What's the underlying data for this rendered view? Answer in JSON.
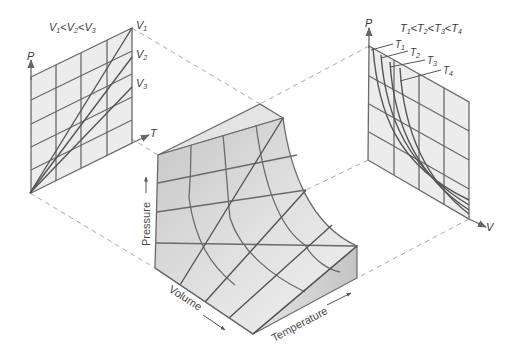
{
  "figure": {
    "left_panel": {
      "title": "V₁<V₂<V₃",
      "title_parts": [
        "V",
        "1",
        "<",
        "V",
        "2",
        "<",
        "V",
        "3"
      ],
      "y_axis_label": "P",
      "x_axis_label": "T",
      "isochore_labels": [
        {
          "base": "V",
          "sub": "1"
        },
        {
          "base": "V",
          "sub": "2"
        },
        {
          "base": "V",
          "sub": "3"
        }
      ]
    },
    "right_panel": {
      "title": "T₁<T₂<T₃<T₄",
      "y_axis_label": "P",
      "x_axis_label": "V",
      "isotherm_labels": [
        {
          "base": "T",
          "sub": "1"
        },
        {
          "base": "T",
          "sub": "2"
        },
        {
          "base": "T",
          "sub": "3"
        },
        {
          "base": "T",
          "sub": "4"
        }
      ]
    },
    "surface": {
      "axis_labels": {
        "pressure": "Pressure",
        "volume": "Volume",
        "temperature": "Temperature"
      }
    },
    "colors": {
      "panel_fill": "#ececec",
      "surface_dark": "#c9c9c9",
      "surface_light": "#ededed",
      "grid_line": "#6a6a6a",
      "dashed_line": "#aaaaaa",
      "text": "#3a3a3a"
    }
  }
}
